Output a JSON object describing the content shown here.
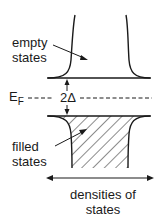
{
  "diagram": {
    "labels": {
      "empty_states": [
        "empty",
        "states"
      ],
      "fermi_level": "E",
      "fermi_subscript": "F",
      "gap": "2Δ",
      "filled_states": [
        "filled",
        "states"
      ],
      "axis_label": [
        "densities of",
        "states"
      ]
    },
    "colors": {
      "ink": "#1a1a1a",
      "background": "#ffffff"
    }
  }
}
